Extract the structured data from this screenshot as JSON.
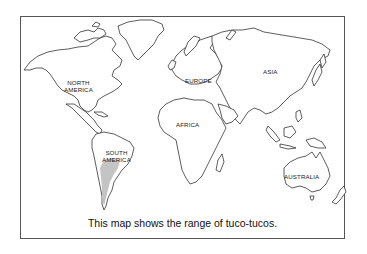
{
  "map": {
    "title": "World map",
    "labels": {
      "north_america": "NORTH\nAMERICA",
      "north_america_line1": "NORTH",
      "north_america_line2": "AMERICA",
      "south_america_line1": "SOUTH",
      "south_america_line2": "AMERICA",
      "europe": "EUROPE",
      "africa": "AFRICA",
      "asia": "ASIA",
      "australia": "AUSTRALIA"
    },
    "highlighted_region": {
      "name": "range of tuco-tucos",
      "continent": "South America",
      "color": "#c4c4c4"
    },
    "colors": {
      "land_fill": "#ffffff",
      "outline": "#333333",
      "frame": "#555555",
      "background": "#ffffff"
    }
  },
  "caption": "This map shows the range of tuco-tucos."
}
